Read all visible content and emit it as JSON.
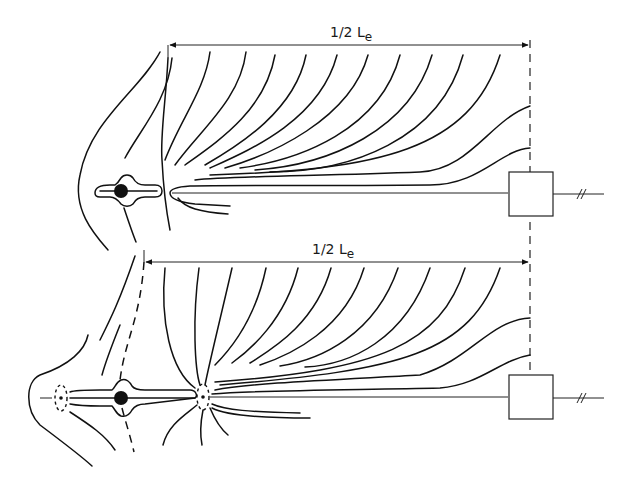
{
  "header": {
    "text": ""
  },
  "diagram": {
    "top": {
      "dimension_label": "1/2 L",
      "dimension_subscript": "e",
      "features": [
        "electrode-with-sheath",
        "conductor-line",
        "field-lines",
        "device-box",
        "break-symbol"
      ]
    },
    "bottom": {
      "dimension_label": "1/2 L",
      "dimension_subscript": "e",
      "features": [
        "electrode-with-sheath",
        "dashed-boundary",
        "dashed-ellipse-nodes",
        "conductor-line",
        "field-lines",
        "device-box",
        "break-symbol"
      ]
    },
    "colors": {
      "line": "#111111",
      "background": "#ffffff"
    }
  }
}
